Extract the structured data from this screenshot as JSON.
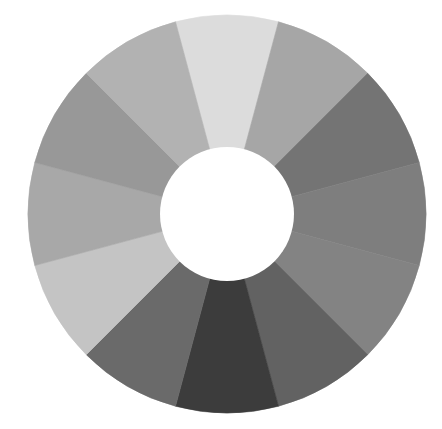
{
  "figure": {
    "kind": "grayscale-wheel",
    "center": [
      227,
      214
    ],
    "outer_radius": 199,
    "inner_radius": 67,
    "segment_count": 12,
    "start_angle_deg": -15,
    "background": "#ffffff",
    "hole_color": "#ffffff"
  },
  "segments": [
    {
      "position": "12 o'clock",
      "color": "#dcdcdc"
    },
    {
      "position": "1 o'clock",
      "color": "#a6a6a6"
    },
    {
      "position": "2 o'clock",
      "color": "#747474"
    },
    {
      "position": "3 o'clock",
      "color": "#7e7e7e"
    },
    {
      "position": "4 o'clock",
      "color": "#838383"
    },
    {
      "position": "5 o'clock",
      "color": "#626262"
    },
    {
      "position": "6 o'clock",
      "color": "#3c3c3c"
    },
    {
      "position": "7 o'clock",
      "color": "#6a6a6a"
    },
    {
      "position": "8 o'clock",
      "color": "#c4c4c4"
    },
    {
      "position": "9 o'clock",
      "color": "#a8a8a8"
    },
    {
      "position": "10 o'clock",
      "color": "#989898"
    },
    {
      "position": "11 o'clock",
      "color": "#b2b2b2"
    }
  ]
}
